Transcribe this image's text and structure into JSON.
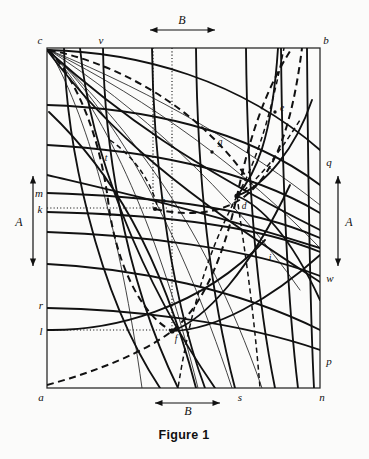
{
  "figure": {
    "caption": "Figure 1",
    "background_color": "#fbfbfa",
    "ink_color": "#111111",
    "frame": {
      "x": 47,
      "y": 48,
      "width": 273,
      "height": 340
    }
  },
  "dimensions": [
    {
      "name": "top-B",
      "label": "B",
      "orientation": "horizontal",
      "x1": 150,
      "x2": 215,
      "y": 30,
      "label_x": 182,
      "label_y": 24
    },
    {
      "name": "bottom-B",
      "label": "B",
      "orientation": "horizontal",
      "x1": 155,
      "x2": 220,
      "y": 403,
      "label_x": 188,
      "label_y": 414
    },
    {
      "name": "left-A",
      "label": "A",
      "orientation": "vertical",
      "y1": 176,
      "y2": 266,
      "x": 33,
      "label_x": 19,
      "label_y": 225
    },
    {
      "name": "right-A",
      "label": "A",
      "orientation": "vertical",
      "y1": 176,
      "y2": 266,
      "x": 338,
      "label_x": 348,
      "label_y": 225
    }
  ],
  "corner_labels": [
    {
      "id": "c",
      "text": "c",
      "x": 40,
      "y": 44,
      "anchor": "middle"
    },
    {
      "id": "b",
      "text": "b",
      "x": 326,
      "y": 44,
      "anchor": "middle"
    },
    {
      "id": "a",
      "text": "a",
      "x": 41,
      "y": 400,
      "anchor": "middle"
    },
    {
      "id": "n",
      "text": "n",
      "x": 322,
      "y": 400,
      "anchor": "middle"
    }
  ],
  "edge_labels": [
    {
      "id": "v",
      "text": "v",
      "x": 101,
      "y": 44,
      "anchor": "middle",
      "edge": "top"
    },
    {
      "id": "m",
      "text": "m",
      "x": 40,
      "y": 196,
      "anchor": "middle",
      "edge": "left"
    },
    {
      "id": "k",
      "text": "k",
      "x": 41,
      "y": 212,
      "anchor": "middle",
      "edge": "left"
    },
    {
      "id": "r",
      "text": "r",
      "x": 41,
      "y": 308,
      "anchor": "middle",
      "edge": "left"
    },
    {
      "id": "l",
      "text": "l",
      "x": 41,
      "y": 334,
      "anchor": "middle",
      "edge": "left"
    },
    {
      "id": "q",
      "text": "q",
      "x": 328,
      "y": 165,
      "anchor": "middle",
      "edge": "right"
    },
    {
      "id": "w",
      "text": "w",
      "x": 329,
      "y": 281,
      "anchor": "middle",
      "edge": "right"
    },
    {
      "id": "p",
      "text": "p",
      "x": 328,
      "y": 364,
      "anchor": "middle",
      "edge": "right"
    },
    {
      "id": "s",
      "text": "s",
      "x": 240,
      "y": 400,
      "anchor": "middle",
      "edge": "bottom"
    }
  ],
  "interior_labels": [
    {
      "id": "t",
      "text": "t",
      "x": 106,
      "y": 160
    },
    {
      "id": "g",
      "text": "g",
      "x": 220,
      "y": 144
    },
    {
      "id": "e",
      "text": "e",
      "x": 281,
      "y": 110
    },
    {
      "id": "h",
      "text": "h",
      "x": 163,
      "y": 203
    },
    {
      "id": "d",
      "text": "d",
      "x": 243,
      "y": 207
    },
    {
      "id": "i",
      "text": "i",
      "x": 270,
      "y": 260
    },
    {
      "id": "f",
      "text": "f",
      "x": 176,
      "y": 340
    }
  ],
  "dotted_guides": [
    {
      "name": "k-horizontal",
      "x1": 47,
      "y1": 208,
      "x2": 167,
      "y2": 208
    },
    {
      "name": "l-horizontal",
      "x1": 47,
      "y1": 330,
      "x2": 173,
      "y2": 330
    },
    {
      "name": "vertical-left",
      "x": 153,
      "y1": 48,
      "y2": 208
    },
    {
      "name": "vertical-right",
      "x": 172,
      "y1": 48,
      "y2": 330
    }
  ],
  "curve_families": [
    {
      "name": "from-c-fan",
      "style": "solid-thin",
      "count": 6,
      "description": "thin rays fanning from corner c"
    },
    {
      "name": "horizontal-family",
      "style": "solid",
      "count": 7,
      "description": "near-horizontal curves from left edge to right edge"
    },
    {
      "name": "vertical-family",
      "style": "solid",
      "count": 6,
      "description": "near-vertical curves from top edge to bottom edge"
    },
    {
      "name": "dashed-family",
      "style": "dashed",
      "count": 4,
      "description": "heavy dashed orthogonal trajectories"
    }
  ],
  "nodes": [
    {
      "id": "d",
      "x": 237,
      "y": 196
    },
    {
      "id": "f",
      "x": 172,
      "y": 331
    },
    {
      "id": "h",
      "x": 155,
      "y": 209
    },
    {
      "id": "g",
      "x": 212,
      "y": 152
    },
    {
      "id": "e",
      "x": 275,
      "y": 112
    },
    {
      "id": "t",
      "x": 100,
      "y": 166
    },
    {
      "id": "i",
      "x": 265,
      "y": 266
    }
  ]
}
